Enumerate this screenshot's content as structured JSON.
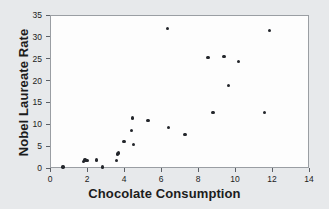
{
  "chart_data": {
    "type": "scatter",
    "title": "",
    "xlabel": "Chocolate Consumption",
    "ylabel": "Nobel Laureate Rate",
    "xlim": [
      0,
      14
    ],
    "ylim": [
      0,
      35
    ],
    "xticks": [
      0,
      2,
      4,
      6,
      8,
      10,
      12,
      14
    ],
    "yticks": [
      0,
      5,
      10,
      15,
      20,
      25,
      30,
      35
    ],
    "xtick_labels": [
      "0",
      "2",
      "4",
      "6",
      "8",
      "10",
      "12",
      "14"
    ],
    "ytick_labels": [
      "0",
      "5",
      "10",
      "15",
      "20",
      "25",
      "30",
      "35"
    ],
    "grid": false,
    "legend": null,
    "marker_color": "#23262b",
    "plot_background": "#fdfdfd",
    "figure_background": "#e7e9eb",
    "points": [
      {
        "x": 0.7,
        "y": 0.2
      },
      {
        "x": 1.8,
        "y": 1.5
      },
      {
        "x": 1.9,
        "y": 1.8
      },
      {
        "x": 2.0,
        "y": 1.7
      },
      {
        "x": 2.5,
        "y": 1.8
      },
      {
        "x": 2.85,
        "y": 0.2
      },
      {
        "x": 3.6,
        "y": 1.7
      },
      {
        "x": 3.65,
        "y": 3.2
      },
      {
        "x": 3.7,
        "y": 3.4
      },
      {
        "x": 4.0,
        "y": 6.1
      },
      {
        "x": 4.4,
        "y": 8.6
      },
      {
        "x": 4.45,
        "y": 11.4
      },
      {
        "x": 4.5,
        "y": 5.4
      },
      {
        "x": 5.3,
        "y": 10.8
      },
      {
        "x": 6.35,
        "y": 31.9
      },
      {
        "x": 6.4,
        "y": 9.2
      },
      {
        "x": 7.3,
        "y": 7.7
      },
      {
        "x": 8.55,
        "y": 25.3
      },
      {
        "x": 8.8,
        "y": 12.7
      },
      {
        "x": 9.4,
        "y": 25.5
      },
      {
        "x": 9.65,
        "y": 18.9
      },
      {
        "x": 10.2,
        "y": 24.3
      },
      {
        "x": 11.6,
        "y": 12.7
      },
      {
        "x": 11.85,
        "y": 31.5
      }
    ]
  }
}
